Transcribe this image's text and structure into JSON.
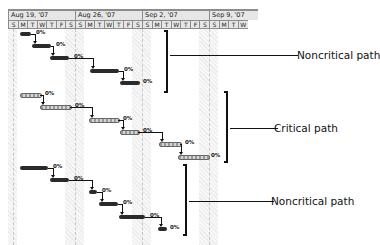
{
  "timescale": {
    "weeks": [
      {
        "label": "Aug 19, '07",
        "x": 0,
        "w": 67
      },
      {
        "label": "Aug 26, '07",
        "x": 67,
        "w": 67
      },
      {
        "label": "Sep 2, '07",
        "x": 134,
        "w": 67
      },
      {
        "label": "Sep 9, '07",
        "x": 201,
        "w": 49
      }
    ],
    "days": [
      "S",
      "M",
      "T",
      "W",
      "T",
      "F",
      "S",
      "S",
      "M",
      "T",
      "W",
      "T",
      "F",
      "S",
      "S",
      "M",
      "T",
      "W",
      "T",
      "F",
      "S",
      "S",
      "M",
      "T",
      "W"
    ],
    "day_width": 9.57
  },
  "groups": [
    {
      "name": "Noncritical path",
      "type": "noncritical",
      "bars": [
        {
          "x": 12,
          "y": 23,
          "w": 11,
          "pct": "0%"
        },
        {
          "x": 24,
          "y": 35,
          "w": 19,
          "pct": "0%"
        },
        {
          "x": 42,
          "y": 47,
          "w": 19,
          "pct": "0%"
        },
        {
          "x": 82,
          "y": 60,
          "w": 29,
          "pct": "0%"
        },
        {
          "x": 112,
          "y": 72,
          "w": 20,
          "pct": "0%"
        }
      ],
      "bracket": {
        "x": 156,
        "y": 21,
        "h": 63
      },
      "callout": {
        "line_x": 162,
        "line_y": 46,
        "line_w": 128,
        "label_x": 297,
        "label_y": 40
      }
    },
    {
      "name": "Critical path",
      "type": "critical",
      "bars": [
        {
          "x": 12,
          "y": 84,
          "w": 20,
          "pct": "0%"
        },
        {
          "x": 32,
          "y": 96,
          "w": 30,
          "pct": "0%"
        },
        {
          "x": 81,
          "y": 109,
          "w": 29,
          "pct": "0%"
        },
        {
          "x": 112,
          "y": 121,
          "w": 18,
          "pct": "0%"
        },
        {
          "x": 151,
          "y": 133,
          "w": 21,
          "pct": "0%"
        },
        {
          "x": 170,
          "y": 146,
          "w": 30,
          "pct": "0%"
        }
      ],
      "bracket": {
        "x": 216,
        "y": 82,
        "h": 72
      },
      "callout": {
        "line_x": 222,
        "line_y": 119,
        "line_w": 48,
        "label_x": 274,
        "label_y": 113
      }
    },
    {
      "name": "Noncritical path",
      "type": "noncritical",
      "bars": [
        {
          "x": 12,
          "y": 157,
          "w": 28,
          "pct": "0%"
        },
        {
          "x": 42,
          "y": 169,
          "w": 19,
          "pct": "0%"
        },
        {
          "x": 81,
          "y": 181,
          "w": 8,
          "pct": "0%"
        },
        {
          "x": 91,
          "y": 193,
          "w": 19,
          "pct": "0%"
        },
        {
          "x": 111,
          "y": 206,
          "w": 26,
          "pct": "0%"
        },
        {
          "x": 150,
          "y": 218,
          "w": 9,
          "pct": "0%"
        }
      ],
      "bracket": {
        "x": 175,
        "y": 155,
        "h": 72
      },
      "callout": {
        "line_x": 181,
        "line_y": 192,
        "line_w": 85,
        "label_x": 271,
        "label_y": 196
      }
    }
  ],
  "weekend_bands": [
    {
      "x": 0,
      "w": 9
    },
    {
      "x": 57,
      "w": 19
    },
    {
      "x": 124,
      "w": 19
    },
    {
      "x": 191,
      "w": 19
    }
  ],
  "labels": {
    "noncritical_top": "Noncritical path",
    "critical": "Critical path",
    "noncritical_bottom": "Noncritical path"
  }
}
